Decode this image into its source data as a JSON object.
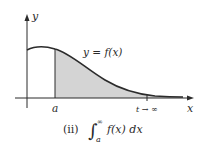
{
  "figure": {
    "y_axis_label": "y",
    "x_axis_label": "x",
    "curve_label": "y = f(x)",
    "lower_limit_label": "a",
    "upper_marker_label": "t → ∞",
    "caption_index": "(ii)",
    "caption_integral_symbol": "∫",
    "caption_upper_limit": "∞",
    "caption_lower_limit": "a",
    "caption_integrand": "f(x) dx",
    "colors": {
      "curve": "#2b2b2b",
      "shading": "#d4d4d4",
      "axes": "#2b2b2b",
      "text": "#2a2a2a"
    }
  }
}
